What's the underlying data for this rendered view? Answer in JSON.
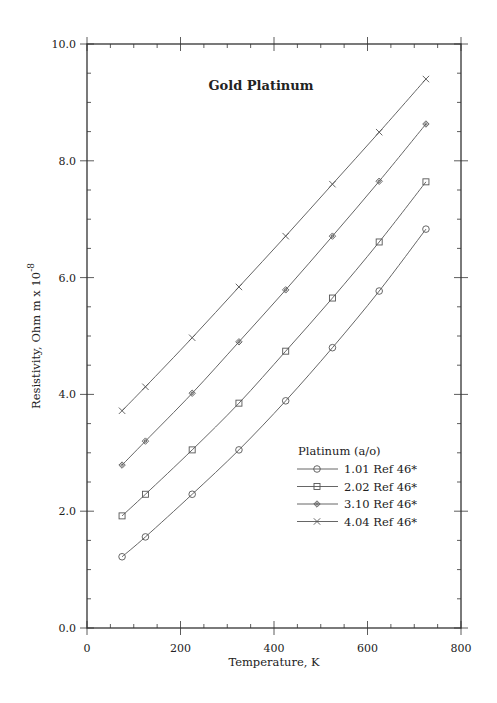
{
  "chart_data": {
    "type": "line",
    "title": "Gold Platinum",
    "xlabel": "Temperature,  K",
    "ylabel": "Resistivity, Ohm m x 10",
    "ylabel_superscript": "-8",
    "xlim": [
      0,
      800
    ],
    "ylim": [
      0.0,
      10.0
    ],
    "xticks": [
      0,
      200,
      400,
      600,
      800
    ],
    "xtick_labels": [
      "0",
      "200",
      "400",
      "600",
      "800"
    ],
    "yticks": [
      0.0,
      2.0,
      4.0,
      6.0,
      8.0,
      10.0
    ],
    "ytick_labels": [
      "0.0",
      "2.0",
      "4.0",
      "6.0",
      "8.0",
      "10.0"
    ],
    "x_minor_step": 50,
    "y_minor_step": 0.5,
    "grid": false,
    "legend_title": "Platinum (a/o)",
    "legend_position": "lower right",
    "x": [
      75,
      125,
      225,
      325,
      425,
      525,
      625,
      725
    ],
    "series": [
      {
        "name": "1.01 Ref 46*",
        "marker": "circle",
        "values": [
          1.22,
          1.56,
          2.29,
          3.05,
          3.89,
          4.8,
          5.77,
          6.83
        ]
      },
      {
        "name": "2.02 Ref 46*",
        "marker": "square",
        "values": [
          1.92,
          2.29,
          3.05,
          3.85,
          4.74,
          5.65,
          6.61,
          7.64
        ]
      },
      {
        "name": "3.10 Ref 46*",
        "marker": "diamond",
        "values": [
          2.79,
          3.2,
          4.02,
          4.9,
          5.79,
          6.71,
          7.65,
          8.63
        ]
      },
      {
        "name": "4.04 Ref 46*",
        "marker": "x",
        "values": [
          3.72,
          4.13,
          4.97,
          5.84,
          6.71,
          7.6,
          8.49,
          9.4
        ]
      }
    ]
  },
  "colors": {
    "axis": "#333333",
    "line": "#555555",
    "text": "#222222",
    "background": "#ffffff"
  }
}
